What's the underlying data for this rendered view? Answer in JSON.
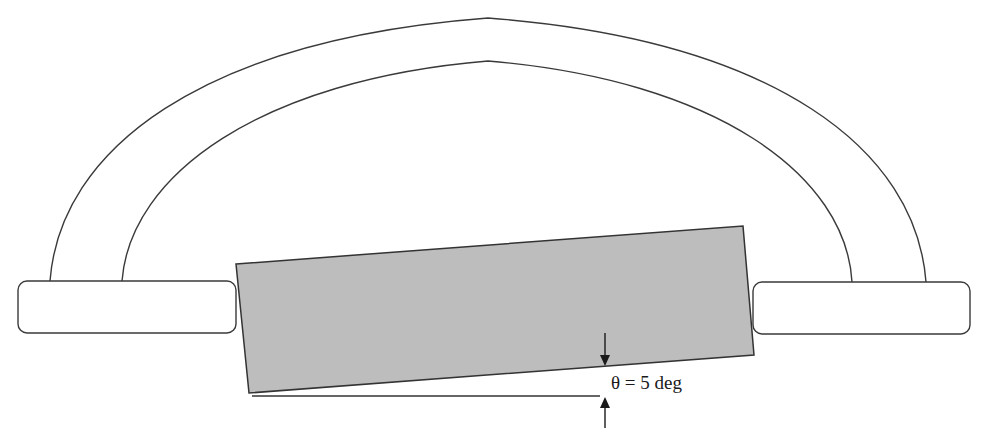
{
  "diagram": {
    "angle_label": "θ = 5 deg",
    "angle": {
      "symbol": "θ",
      "value": 5,
      "unit": "deg"
    },
    "components": [
      {
        "name": "outer-arch",
        "kind": "arc"
      },
      {
        "name": "inner-arch",
        "kind": "arc"
      },
      {
        "name": "left-support-pad",
        "kind": "rounded-rectangle"
      },
      {
        "name": "right-support-pad",
        "kind": "rounded-rectangle"
      },
      {
        "name": "tilted-block",
        "kind": "rectangle",
        "tilt_deg": 5
      },
      {
        "name": "horizontal-reference-line",
        "kind": "line"
      },
      {
        "name": "angle-indicator-arrows",
        "kind": "arrow-pair"
      }
    ],
    "colors": {
      "block_fill": "#bdbdbd",
      "outline": "#3a3a3a",
      "background": "#ffffff"
    }
  }
}
